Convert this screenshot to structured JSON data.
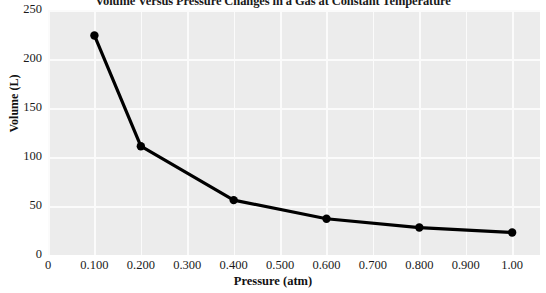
{
  "chart_data": {
    "type": "line",
    "title": "Volume Versus Pressure Changes in a Gas at Constant Temperature",
    "xlabel": "Pressure (atm)",
    "ylabel": "Volume (L)",
    "xlim": [
      0,
      1.06
    ],
    "ylim": [
      0,
      250
    ],
    "grid": true,
    "legend": "none",
    "marker": "circle",
    "line_color": "#000000",
    "marker_color": "#000000",
    "plot_background": "#ececec",
    "gridline_color": "#fbfbfb",
    "x": [
      0.1,
      0.2,
      0.4,
      0.6,
      0.8,
      1.0
    ],
    "values": [
      224,
      111,
      56,
      37,
      28,
      23
    ],
    "series": [
      {
        "name": "Volume",
        "points": [
          {
            "x": 0.1,
            "y": 224
          },
          {
            "x": 0.2,
            "y": 111
          },
          {
            "x": 0.4,
            "y": 56
          },
          {
            "x": 0.6,
            "y": 37
          },
          {
            "x": 0.8,
            "y": 28
          },
          {
            "x": 1.0,
            "y": 23
          }
        ]
      }
    ],
    "xticks": [
      0,
      0.1,
      0.2,
      0.3,
      0.4,
      0.5,
      0.6,
      0.7,
      0.8,
      0.9,
      1.0
    ],
    "xtick_labels": [
      "0",
      "0.100",
      "0.200",
      "0.300",
      "0.400",
      "0.500",
      "0.600",
      "0.700",
      "0.800",
      "0.900",
      "1.00"
    ],
    "yticks": [
      0,
      50,
      100,
      150,
      200,
      250
    ],
    "ytick_labels": [
      "0",
      "50",
      "100",
      "150",
      "200",
      "250"
    ]
  }
}
